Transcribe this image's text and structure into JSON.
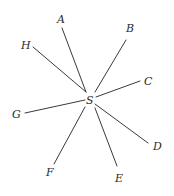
{
  "diagram": {
    "center": {
      "label": "S",
      "x": 90,
      "y": 100
    },
    "rays": [
      {
        "label": "A",
        "x1": 62,
        "y1": 28,
        "x2": 86,
        "y2": 92,
        "lx": 57,
        "ly": 23
      },
      {
        "label": "B",
        "x1": 126,
        "y1": 40,
        "x2": 95,
        "y2": 92,
        "lx": 126,
        "ly": 32
      },
      {
        "label": "C",
        "x1": 140,
        "y1": 81,
        "x2": 96,
        "y2": 97,
        "lx": 144,
        "ly": 85
      },
      {
        "label": "D",
        "x1": 148,
        "y1": 143,
        "x2": 95,
        "y2": 104,
        "lx": 153,
        "ly": 150
      },
      {
        "label": "E",
        "x1": 117,
        "y1": 166,
        "x2": 95,
        "y2": 108,
        "lx": 115,
        "ly": 182
      },
      {
        "label": "F",
        "x1": 54,
        "y1": 164,
        "x2": 85,
        "y2": 107,
        "lx": 46,
        "ly": 176
      },
      {
        "label": "G",
        "x1": 25,
        "y1": 113,
        "x2": 85,
        "y2": 100,
        "lx": 12,
        "ly": 118
      },
      {
        "label": "H",
        "x1": 33,
        "y1": 47,
        "x2": 86,
        "y2": 92,
        "lx": 21,
        "ly": 49
      }
    ]
  }
}
